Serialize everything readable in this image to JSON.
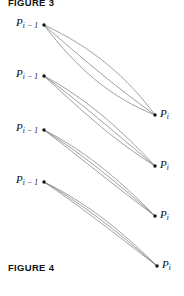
{
  "figure": {
    "caption_top": "FIGURE 3",
    "caption_bottom": "FIGURE 4",
    "background_color": "#ffffff",
    "ink_color": "#6b6b6b",
    "dot_color": "#111111"
  },
  "labels": {
    "left": [
      {
        "base": "P",
        "sub": "i − 1"
      },
      {
        "base": "P",
        "sub": "i − 1"
      },
      {
        "base": "P",
        "sub": "i − 1"
      },
      {
        "base": "P",
        "sub": "i − 1"
      }
    ],
    "right": [
      {
        "base": "P",
        "sub": "i"
      },
      {
        "base": "P",
        "sub": "i"
      },
      {
        "base": "P",
        "sub": "i"
      },
      {
        "base": "P",
        "sub": "i"
      }
    ]
  },
  "chart_data": {
    "type": "line",
    "xlabel": "",
    "ylabel": "",
    "xlim": [
      0,
      184
    ],
    "ylim": [
      0,
      296
    ],
    "grid": false,
    "legend": null,
    "rows": [
      {
        "iteration": 1,
        "start_point": {
          "x": 44,
          "y": 25,
          "label": "P i-1"
        },
        "end_point": {
          "x": 155,
          "y": 115,
          "label": "P i"
        },
        "spread": "wide",
        "curve_count": 3,
        "series": [
          {
            "name": "curve-1-a",
            "path_points": [
              [
                44,
                25
              ],
              [
                92,
                47
              ],
              [
                128,
                78
              ],
              [
                155,
                115
              ]
            ]
          },
          {
            "name": "curve-1-b",
            "path_points": [
              [
                44,
                25
              ],
              [
                86,
                62
              ],
              [
                120,
                90
              ],
              [
                155,
                115
              ]
            ]
          },
          {
            "name": "curve-1-c",
            "path_points": [
              [
                44,
                25
              ],
              [
                78,
                70
              ],
              [
                112,
                98
              ],
              [
                155,
                115
              ]
            ]
          }
        ]
      },
      {
        "iteration": 2,
        "start_point": {
          "x": 44,
          "y": 76,
          "label": "P i-1"
        },
        "end_point": {
          "x": 155,
          "y": 166,
          "label": "P i"
        },
        "spread": "medium",
        "curve_count": 3,
        "series": [
          {
            "name": "curve-2-a",
            "path_points": [
              [
                44,
                76
              ],
              [
                82,
                96
              ],
              [
                118,
                126
              ],
              [
                155,
                166
              ]
            ]
          },
          {
            "name": "curve-2-b",
            "path_points": [
              [
                44,
                76
              ],
              [
                79,
                101
              ],
              [
                114,
                132
              ],
              [
                155,
                166
              ]
            ]
          },
          {
            "name": "curve-2-c",
            "path_points": [
              [
                44,
                76
              ],
              [
                76,
                105
              ],
              [
                110,
                138
              ],
              [
                155,
                166
              ]
            ]
          }
        ]
      },
      {
        "iteration": 3,
        "start_point": {
          "x": 44,
          "y": 130,
          "label": "P i-1"
        },
        "end_point": {
          "x": 155,
          "y": 216,
          "label": "P i"
        },
        "spread": "narrow",
        "curve_count": 3,
        "series": [
          {
            "name": "curve-3-a",
            "path_points": [
              [
                44,
                130
              ],
              [
                80,
                148
              ],
              [
                116,
                176
              ],
              [
                155,
                216
              ]
            ]
          },
          {
            "name": "curve-3-b",
            "path_points": [
              [
                44,
                130
              ],
              [
                78,
                151
              ],
              [
                114,
                180
              ],
              [
                155,
                216
              ]
            ]
          },
          {
            "name": "curve-3-c",
            "path_points": [
              [
                44,
                130
              ],
              [
                76,
                154
              ],
              [
                112,
                184
              ],
              [
                155,
                216
              ]
            ]
          }
        ]
      },
      {
        "iteration": 4,
        "start_point": {
          "x": 44,
          "y": 182,
          "label": "P i-1"
        },
        "end_point": {
          "x": 157,
          "y": 266,
          "label": "P i"
        },
        "spread": "very-narrow",
        "curve_count": 3,
        "series": [
          {
            "name": "curve-4-a",
            "path_points": [
              [
                44,
                182
              ],
              [
                80,
                199
              ],
              [
                118,
                227
              ],
              [
                157,
                266
              ]
            ]
          },
          {
            "name": "curve-4-b",
            "path_points": [
              [
                44,
                182
              ],
              [
                78,
                201
              ],
              [
                116,
                230
              ],
              [
                157,
                266
              ]
            ]
          },
          {
            "name": "curve-4-c",
            "path_points": [
              [
                44,
                182
              ],
              [
                76,
                203
              ],
              [
                114,
                233
              ],
              [
                157,
                266
              ]
            ]
          }
        ]
      }
    ]
  }
}
